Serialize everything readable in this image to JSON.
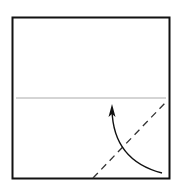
{
  "diagram": {
    "type": "origami-step",
    "elements": {
      "paper": {
        "shape": "square",
        "border_color": "#111111"
      },
      "crease": {
        "style": "solid",
        "orientation": "horizontal",
        "color": "#aaaaaa"
      },
      "valley_fold": {
        "style": "dashed",
        "orientation": "diagonal",
        "color": "#333333"
      },
      "fold_arrow": {
        "style": "curved",
        "direction": "up-left",
        "color": "#111111"
      }
    }
  }
}
